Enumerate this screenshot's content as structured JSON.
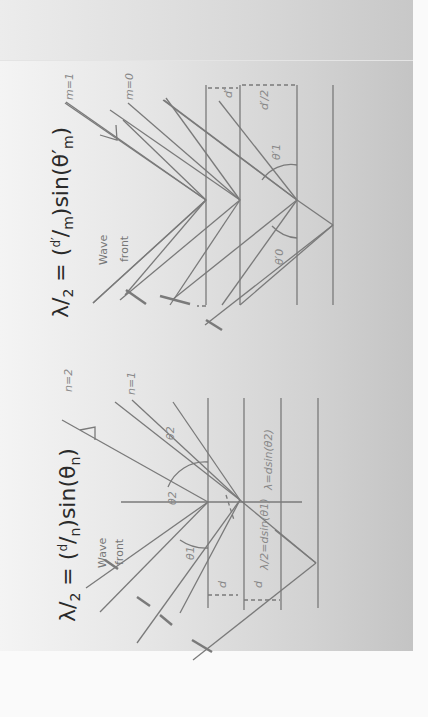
{
  "figure": {
    "top_diagram": {
      "equation": {
        "lambda": "λ",
        "over": "2",
        "eq": "=",
        "d": "d′",
        "order": "m",
        "sin": "sin",
        "theta": "θ′",
        "sub": "m"
      },
      "order_labels": [
        "m=1",
        "m=0"
      ],
      "wave_front_label": [
        "Wave",
        "front"
      ],
      "angle_labels": [
        "θ′0",
        "θ′1"
      ],
      "spacing_labels": [
        "d′",
        "d′/2"
      ]
    },
    "bottom_diagram": {
      "equation": {
        "lambda": "λ",
        "over": "2",
        "eq": "=",
        "d": "d",
        "order": "n",
        "sin": "sin",
        "theta": "θ",
        "sub": "n"
      },
      "order_labels": [
        "n=2",
        "n=1"
      ],
      "wave_front_label": [
        "Wave",
        "front"
      ],
      "angle_labels": [
        "θ1",
        "θ2",
        "θ2"
      ],
      "path_labels": [
        "λ=dsin(θ2)",
        "λ/2=dsin(θ1)"
      ],
      "spacing_labels": [
        "d",
        "d"
      ]
    },
    "colors": {
      "line": "#7a7a7a",
      "text": "#2a2a2a",
      "label": "#808080"
    }
  }
}
